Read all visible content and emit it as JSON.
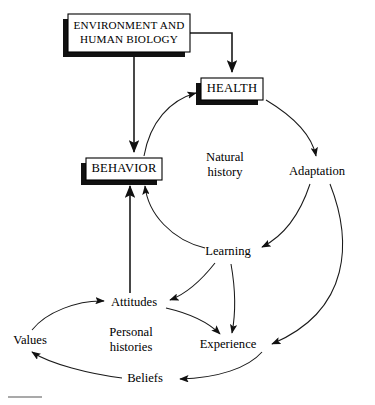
{
  "diagram": {
    "background_color": "#ffffff",
    "line_color": "#1a1a1a",
    "box_fill": "#ffffff",
    "box_border": "#000000",
    "box_shadow_color": "#111111",
    "boxes": [
      {
        "id": "environment",
        "name": "environment-box",
        "lines": [
          "ENVIRONMENT AND",
          "HUMAN BIOLOGY"
        ],
        "x": 68,
        "y": 14,
        "width": 122,
        "height": 38
      },
      {
        "id": "health",
        "name": "health-box",
        "lines": [
          "HEALTH"
        ],
        "x": 201,
        "y": 78,
        "width": 62,
        "height": 22
      },
      {
        "id": "behavior",
        "name": "behavior-box",
        "lines": [
          "BEHAVIOR"
        ],
        "x": 86,
        "y": 158,
        "width": 76,
        "height": 22
      }
    ],
    "nodes": [
      {
        "id": "natural_history",
        "name": "natural-history-label",
        "lines": [
          "Natural",
          "history"
        ],
        "x": 225,
        "y": 166
      },
      {
        "id": "adaptation",
        "name": "adaptation-label",
        "lines": [
          "Adaptation"
        ],
        "x": 317,
        "y": 172
      },
      {
        "id": "learning",
        "name": "learning-label",
        "lines": [
          "Learning"
        ],
        "x": 228,
        "y": 252
      },
      {
        "id": "attitudes",
        "name": "attitudes-label",
        "lines": [
          "Attitudes"
        ],
        "x": 134,
        "y": 303
      },
      {
        "id": "values",
        "name": "values-label",
        "lines": [
          "Values"
        ],
        "x": 30,
        "y": 341
      },
      {
        "id": "personal_histories",
        "name": "personal-histories-label",
        "lines": [
          "Personal",
          "histories"
        ],
        "x": 131,
        "y": 341
      },
      {
        "id": "experience",
        "name": "experience-label",
        "lines": [
          "Experience"
        ],
        "x": 228,
        "y": 345
      },
      {
        "id": "beliefs",
        "name": "beliefs-label",
        "lines": [
          "Beliefs"
        ],
        "x": 145,
        "y": 379
      }
    ],
    "edges": [
      {
        "id": "env-to-behavior",
        "name": "edge-environment-to-behavior",
        "from": "environment",
        "to": "behavior",
        "style": "straight",
        "path": "M 134 56 L 134 152"
      },
      {
        "id": "env-to-health",
        "name": "edge-environment-to-health",
        "from": "environment",
        "to": "health",
        "style": "elbow",
        "path": "M 190 33 L 232 33 L 232 72"
      },
      {
        "id": "behavior-to-health",
        "name": "edge-behavior-to-health",
        "from": "behavior",
        "to": "health",
        "style": "curve",
        "path": "M 144 156 C 150 122 170 100 196 93"
      },
      {
        "id": "health-to-adaptation",
        "name": "edge-health-to-adaptation",
        "from": "health",
        "to": "adaptation",
        "style": "curve",
        "path": "M 266 100 C 296 118 312 136 316 156"
      },
      {
        "id": "adaptation-to-learning",
        "name": "edge-adaptation-to-learning",
        "from": "adaptation",
        "to": "learning",
        "style": "curve",
        "path": "M 310 184 C 300 214 284 236 262 247"
      },
      {
        "id": "adaptation-to-experience",
        "name": "edge-adaptation-to-experience",
        "from": "adaptation",
        "to": "experience",
        "style": "curve",
        "path": "M 330 184 C 352 240 352 310 272 344"
      },
      {
        "id": "learning-to-behavior",
        "name": "edge-learning-to-behavior",
        "from": "learning",
        "to": "behavior",
        "style": "curve",
        "path": "M 205 248 C 172 240 148 214 145 186"
      },
      {
        "id": "learning-to-attitudes",
        "name": "edge-learning-to-attitudes",
        "from": "learning",
        "to": "attitudes",
        "style": "curve",
        "path": "M 215 263 C 200 282 186 294 170 300"
      },
      {
        "id": "learning-to-experience",
        "name": "edge-learning-to-experience",
        "from": "learning",
        "to": "experience",
        "style": "curve",
        "path": "M 231 264 C 236 292 236 312 232 333"
      },
      {
        "id": "attitudes-to-behavior",
        "name": "edge-attitudes-to-behavior",
        "from": "attitudes",
        "to": "behavior",
        "style": "straight",
        "path": "M 130 293 L 130 186"
      },
      {
        "id": "values-to-attitudes",
        "name": "edge-values-to-attitudes",
        "from": "values",
        "to": "attitudes",
        "style": "curve",
        "path": "M 32 330 C 46 312 78 300 104 301"
      },
      {
        "id": "attitudes-to-experience",
        "name": "edge-attitudes-to-experience",
        "from": "attitudes",
        "to": "experience",
        "style": "curve",
        "path": "M 166 308 C 192 314 210 324 220 334"
      },
      {
        "id": "experience-to-beliefs",
        "name": "edge-experience-to-beliefs",
        "from": "experience",
        "to": "beliefs",
        "style": "curve",
        "path": "M 262 352 C 248 368 218 378 180 379"
      },
      {
        "id": "beliefs-to-values",
        "name": "edge-beliefs-to-values",
        "from": "beliefs",
        "to": "values",
        "style": "curve",
        "path": "M 122 378 C 90 374 50 364 32 352"
      }
    ],
    "footer_rule": {
      "name": "footer-rule",
      "x1": 8,
      "y1": 397,
      "x2": 42,
      "y2": 397
    }
  }
}
